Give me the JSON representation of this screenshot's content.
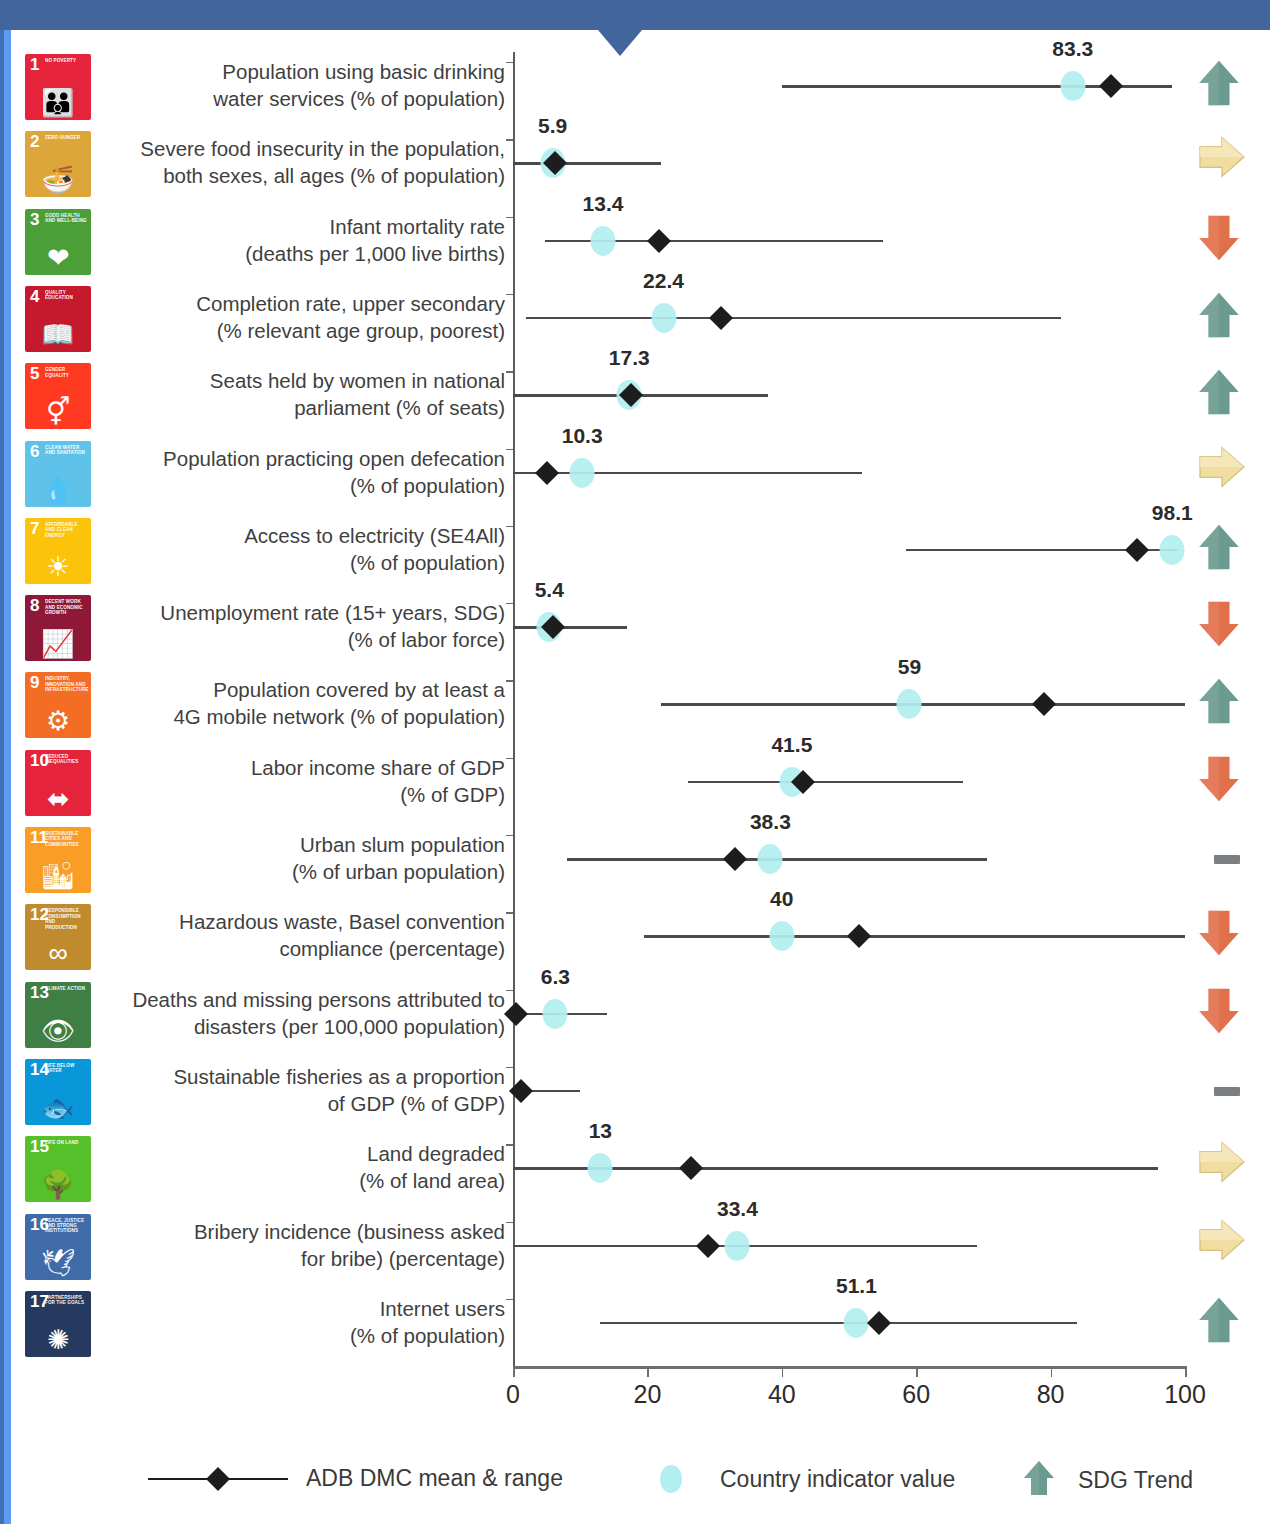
{
  "legend": {
    "range_label": "ADB DMC mean & range",
    "dot_label": "Country indicator value",
    "trend_label": "SDG Trend"
  },
  "axis": {
    "ticks": [
      "0",
      "20",
      "40",
      "60",
      "80",
      "100"
    ],
    "min": 0,
    "max": 100
  },
  "colors": {
    "accent_blue": "#42659c",
    "side_blue": "#5b9bf0",
    "dot": "#b2eff0",
    "diamond": "#1d1d1d",
    "range_line": "#4a4a4a",
    "trend_up": "#6b9a90",
    "trend_flat": "#f0dda1",
    "trend_down": "#e0704a",
    "trend_none": "#7b7f82"
  },
  "chart_data": {
    "type": "scatter",
    "title": "",
    "xlabel": "",
    "ylabel": "",
    "xlim": [
      0,
      100
    ],
    "grid": false,
    "legend_position": "bottom",
    "series": [
      {
        "name": "ADB DMC mean & range",
        "marker": "diamond-with-range-line"
      },
      {
        "name": "Country indicator value",
        "marker": "dot"
      }
    ],
    "rows": [
      {
        "sdg": 1,
        "sdg_color": "#e5243b",
        "sdg_title": "NO POVERTY",
        "glyph": "👪",
        "label": "Population using basic drinking water services (% of population)",
        "label_lines": [
          "Population using basic drinking",
          "water services (% of population)"
        ],
        "value": 83.3,
        "value_text": "83.3",
        "mean": 89.0,
        "range_min": 40.0,
        "range_max": 98.0,
        "trend": "up"
      },
      {
        "sdg": 2,
        "sdg_color": "#dda63a",
        "sdg_title": "ZERO HUNGER",
        "glyph": "🍜",
        "label": "Severe food insecurity in the population, both sexes, all ages (% of population)",
        "label_lines": [
          "Severe food insecurity in the population,",
          "both sexes, all ages (% of population)"
        ],
        "value": 5.9,
        "value_text": "5.9",
        "mean": 6.2,
        "range_min": 0.0,
        "range_max": 22.0,
        "trend": "flat"
      },
      {
        "sdg": 3,
        "sdg_color": "#4c9f38",
        "sdg_title": "GOOD HEALTH AND WELL-BEING",
        "glyph": "❤",
        "label": "Infant mortality rate (deaths per 1,000 live births)",
        "label_lines": [
          "Infant mortality rate",
          "(deaths per 1,000 live births)"
        ],
        "value": 13.4,
        "value_text": "13.4",
        "mean": 21.8,
        "range_min": 4.8,
        "range_max": 55.0,
        "trend": "down"
      },
      {
        "sdg": 4,
        "sdg_color": "#c5192d",
        "sdg_title": "QUALITY EDUCATION",
        "glyph": "📖",
        "label": "Completion rate, upper secondary (% relevant age group, poorest)",
        "label_lines": [
          "Completion rate, upper secondary",
          "(% relevant age group, poorest)"
        ],
        "value": 22.4,
        "value_text": "22.4",
        "mean": 31.0,
        "range_min": 2.0,
        "range_max": 81.5,
        "trend": "up"
      },
      {
        "sdg": 5,
        "sdg_color": "#ff3a21",
        "sdg_title": "GENDER EQUALITY",
        "glyph": "⚥",
        "label": "Seats held by women in national parliament (% of seats)",
        "label_lines": [
          "Seats held by women in national",
          "parliament (% of seats)"
        ],
        "value": 17.3,
        "value_text": "17.3",
        "mean": 17.6,
        "range_min": 0.0,
        "range_max": 38.0,
        "trend": "up"
      },
      {
        "sdg": 6,
        "sdg_color": "#5fc2e8",
        "sdg_title": "CLEAN WATER AND SANITATION",
        "glyph": "💧",
        "label": "Population practicing open defecation (% of population)",
        "label_lines": [
          "Population practicing open defecation",
          "(% of population)"
        ],
        "value": 10.3,
        "value_text": "10.3",
        "mean": 5.0,
        "range_min": 0.0,
        "range_max": 52.0,
        "trend": "flat"
      },
      {
        "sdg": 7,
        "sdg_color": "#fcc30b",
        "sdg_title": "AFFORDABLE AND CLEAN ENERGY",
        "glyph": "☀",
        "label": "Access to electricity (SE4All) (% of population)",
        "label_lines": [
          "Access to electricity (SE4All)",
          "(% of population)"
        ],
        "value": 98.1,
        "value_text": "98.1",
        "mean": 92.8,
        "range_min": 58.5,
        "range_max": 99.0,
        "trend": "up"
      },
      {
        "sdg": 8,
        "sdg_color": "#8f1838",
        "sdg_title": "DECENT WORK AND ECONOMIC GROWTH",
        "glyph": "📈",
        "label": "Unemployment rate (15+ years, SDG) (% of labor force)",
        "label_lines": [
          "Unemployment rate (15+ years, SDG)",
          "(% of labor force)"
        ],
        "value": 5.4,
        "value_text": "5.4",
        "mean": 5.9,
        "range_min": 0.0,
        "range_max": 17.0,
        "trend": "down"
      },
      {
        "sdg": 9,
        "sdg_color": "#f36d25",
        "sdg_title": "INDUSTRY, INNOVATION AND INFRASTRUCTURE",
        "glyph": "⚙",
        "label": "Population covered by at least a 4G mobile network (% of population)",
        "label_lines": [
          "Population covered by at least a",
          "4G mobile network (% of population)"
        ],
        "value": 59.0,
        "value_text": "59",
        "mean": 79.0,
        "range_min": 22.0,
        "range_max": 100.0,
        "trend": "up"
      },
      {
        "sdg": 10,
        "sdg_color": "#e5243b",
        "sdg_title": "REDUCED INEQUALITIES",
        "glyph": "⬌",
        "label": "Labor income share of GDP (% of GDP)",
        "label_lines": [
          "Labor income share of GDP",
          "(% of GDP)"
        ],
        "value": 41.5,
        "value_text": "41.5",
        "mean": 43.2,
        "range_min": 26.0,
        "range_max": 67.0,
        "trend": "down"
      },
      {
        "sdg": 11,
        "sdg_color": "#f99d26",
        "sdg_title": "SUSTAINABLE CITIES AND COMMUNITIES",
        "glyph": "🏙",
        "label": "Urban slum population (% of urban population)",
        "label_lines": [
          "Urban slum population",
          "(% of urban population)"
        ],
        "value": 38.3,
        "value_text": "38.3",
        "mean": 33.0,
        "range_min": 8.0,
        "range_max": 70.5,
        "trend": "none"
      },
      {
        "sdg": 12,
        "sdg_color": "#bf8b2e",
        "sdg_title": "RESPONSIBLE CONSUMPTION AND PRODUCTION",
        "glyph": "∞",
        "label": "Hazardous waste, Basel convention compliance (percentage)",
        "label_lines": [
          "Hazardous waste, Basel convention",
          "compliance (percentage)"
        ],
        "value": 40.0,
        "value_text": "40",
        "mean": 51.5,
        "range_min": 19.5,
        "range_max": 100.0,
        "trend": "down"
      },
      {
        "sdg": 13,
        "sdg_color": "#3f7e44",
        "sdg_title": "CLIMATE ACTION",
        "glyph": "👁",
        "label": "Deaths and missing persons attributed to disasters (per 100,000 population)",
        "label_lines": [
          "Deaths and missing persons attributed to",
          "disasters (per 100,000 population)"
        ],
        "value": 6.3,
        "value_text": "6.3",
        "mean": 0.5,
        "range_min": 0.0,
        "range_max": 14.0,
        "trend": "down"
      },
      {
        "sdg": 14,
        "sdg_color": "#0a97d9",
        "sdg_title": "LIFE BELOW WATER",
        "glyph": "🐟",
        "label": "Sustainable fisheries as a proportion of GDP (% of GDP)",
        "label_lines": [
          "Sustainable fisheries as a proportion",
          "of GDP (% of GDP)"
        ],
        "value": null,
        "value_text": "",
        "mean": 1.2,
        "range_min": 0.0,
        "range_max": 10.0,
        "trend": "none"
      },
      {
        "sdg": 15,
        "sdg_color": "#56c02b",
        "sdg_title": "LIFE ON LAND",
        "glyph": "🌳",
        "label": "Land degraded (% of land area)",
        "label_lines": [
          "Land degraded",
          "(% of land area)"
        ],
        "value": 13.0,
        "value_text": "13",
        "mean": 26.5,
        "range_min": 0.0,
        "range_max": 96.0,
        "trend": "flat"
      },
      {
        "sdg": 16,
        "sdg_color": "#3f6ca8",
        "sdg_title": "PEACE, JUSTICE AND STRONG INSTITUTIONS",
        "glyph": "🕊",
        "label": "Bribery incidence (business asked for bribe) (percentage)",
        "label_lines": [
          "Bribery incidence (business asked",
          "for bribe)  (percentage)"
        ],
        "value": 33.4,
        "value_text": "33.4",
        "mean": 29.0,
        "range_min": 0.0,
        "range_max": 69.0,
        "trend": "flat"
      },
      {
        "sdg": 17,
        "sdg_color": "#26395e",
        "sdg_title": "PARTNERSHIPS FOR THE GOALS",
        "glyph": "✺",
        "label": "Internet users (% of population)",
        "label_lines": [
          "Internet users",
          "(% of population)"
        ],
        "value": 51.1,
        "value_text": "51.1",
        "mean": 54.5,
        "range_min": 13.0,
        "range_max": 84.0,
        "trend": "up"
      }
    ]
  }
}
